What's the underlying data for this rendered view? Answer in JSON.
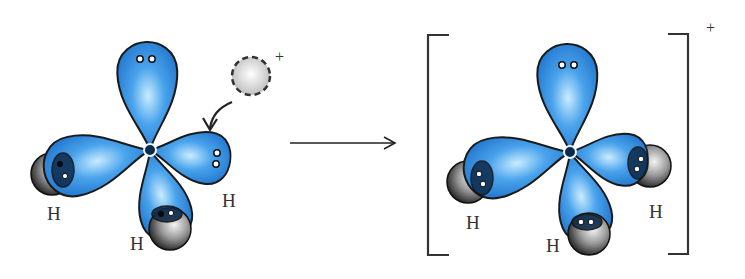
{
  "diagram": {
    "reactant": {
      "molecule": "NH3",
      "hydrogen_labels": [
        "H",
        "H",
        "H"
      ],
      "lone_pair_lobe": "top"
    },
    "proton": {
      "charge": "+"
    },
    "reaction_arrow": "→",
    "product": {
      "molecule": "NH4+",
      "hydrogen_labels": [
        "H",
        "H",
        "H"
      ],
      "charge": "+"
    },
    "colors": {
      "orbital": "#2f86d8",
      "orbital_highlight": "#bfe6ff",
      "outline": "#1a1a1a",
      "hydrogen_sphere": "#6b6b6b",
      "proton": "#d8d8d8"
    }
  }
}
